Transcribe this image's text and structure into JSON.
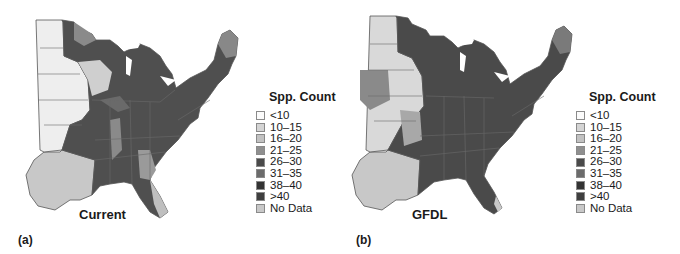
{
  "panels": [
    {
      "letter": "(a)",
      "label": "Current",
      "legend": {
        "title": "Spp. Count",
        "items": [
          {
            "label": "<10",
            "color": "#fbfbfb"
          },
          {
            "label": "10–15",
            "color": "#d4d4d4"
          },
          {
            "label": "16–20",
            "color": "#c2c2c2"
          },
          {
            "label": "21–25",
            "color": "#8f8f8f"
          },
          {
            "label": "26–30",
            "color": "#4a4a4a"
          },
          {
            "label": "31–35",
            "color": "#6b6b6b"
          },
          {
            "label": "38–40",
            "color": "#333333"
          },
          {
            "label": ">40",
            "color": "#3f3f3f"
          },
          {
            "label": "No Data",
            "color": "#c8c8c8"
          }
        ]
      }
    },
    {
      "letter": "(b)",
      "label": "GFDL",
      "legend": {
        "title": "Spp. Count",
        "items": [
          {
            "label": "<10",
            "color": "#fbfbfb"
          },
          {
            "label": "10–15",
            "color": "#d4d4d4"
          },
          {
            "label": "16–20",
            "color": "#c2c2c2"
          },
          {
            "label": "21–25",
            "color": "#8f8f8f"
          },
          {
            "label": "26–30",
            "color": "#4a4a4a"
          },
          {
            "label": "31–35",
            "color": "#6b6b6b"
          },
          {
            "label": "38–40",
            "color": "#333333"
          },
          {
            "label": ">40",
            "color": "#3f3f3f"
          },
          {
            "label": "No Data",
            "color": "#c8c8c8"
          }
        ]
      }
    }
  ],
  "colors": {
    "state_border": "#555555",
    "no_data": "#c8c8c8",
    "dark": "#4a4a4a",
    "mid": "#8f8f8f",
    "light": "#e6e6e6"
  }
}
